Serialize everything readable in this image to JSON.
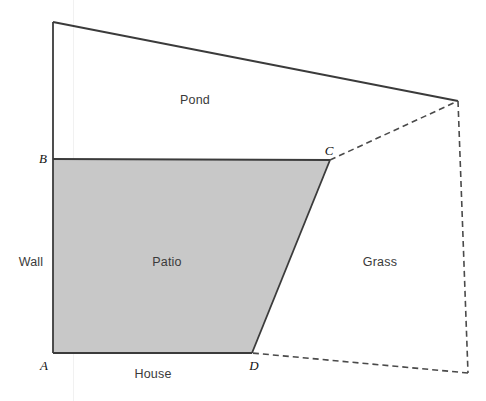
{
  "canvas": {
    "width": 486,
    "height": 401,
    "background": "#ffffff"
  },
  "style": {
    "patio_fill": "#c8c8c8",
    "solid_stroke": "#3b3b3b",
    "dashed_stroke": "#4a4a4a",
    "solid_width": 1.8,
    "dashed_width": 1.6,
    "dash_pattern": "6,4",
    "label_color": "#3a3a3a",
    "vertex_color": "#111111"
  },
  "vertices": {
    "A": {
      "label": "A",
      "x": 53,
      "y": 353,
      "label_x": 44,
      "label_y": 366
    },
    "B": {
      "label": "B",
      "x": 53,
      "y": 159,
      "label_x": 43,
      "label_y": 159
    },
    "C": {
      "label": "C",
      "x": 330,
      "y": 160,
      "label_x": 329,
      "label_y": 151
    },
    "D": {
      "label": "D",
      "x": 252,
      "y": 353,
      "label_x": 254,
      "label_y": 366
    },
    "wall_top": {
      "label": "",
      "x": 53,
      "y": 22
    },
    "pond_right": {
      "label": "",
      "x": 458,
      "y": 101
    },
    "grass_right": {
      "label": "",
      "x": 468,
      "y": 373
    }
  },
  "shapes": {
    "patio_polygon_points": "53,159 330,160 252,353 53,353",
    "solid_paths": [
      {
        "name": "wall-line",
        "d": "M 53 22 L 53 353"
      },
      {
        "name": "pond-top-edge",
        "d": "M 53 22 L 458 101"
      },
      {
        "name": "patio-top-edge-BC",
        "d": "M 53 159 L 330 160"
      },
      {
        "name": "patio-right-edge-CD",
        "d": "M 330 160 L 252 353"
      },
      {
        "name": "house-edge-AD",
        "d": "M 53 353 L 252 353"
      }
    ],
    "dashed_paths": [
      {
        "name": "grass-upper-edge-C-to-pond-right",
        "d": "M 330 160 L 458 101"
      },
      {
        "name": "grass-right-edge",
        "d": "M 458 101 L 468 373"
      },
      {
        "name": "grass-lower-edge-to-D",
        "d": "M 468 373 L 252 353"
      }
    ]
  },
  "labels": {
    "pond": {
      "text": "Pond",
      "x": 195,
      "y": 100
    },
    "wall": {
      "text": "Wall",
      "x": 31,
      "y": 262
    },
    "patio": {
      "text": "Patio",
      "x": 167,
      "y": 262
    },
    "grass": {
      "text": "Grass",
      "x": 380,
      "y": 262
    },
    "house": {
      "text": "House",
      "x": 153,
      "y": 374
    }
  },
  "artifacts": {
    "scan_streak_x": 73
  }
}
